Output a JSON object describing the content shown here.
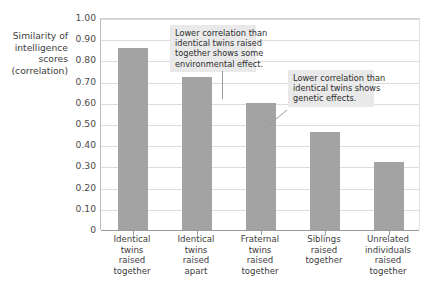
{
  "chart_data": {
    "type": "bar",
    "title": "",
    "xlabel": "",
    "ylabel": "Similarity of intelligence scores (correlation)",
    "ylim": [
      0,
      1.0
    ],
    "grid": true,
    "legend": "none",
    "categories": [
      "Identical twins raised together",
      "Identical twins raised apart",
      "Fraternal twins raised together",
      "Siblings raised together",
      "Unrelated individuals raised together"
    ],
    "values": [
      0.86,
      0.72,
      0.6,
      0.46,
      0.32
    ],
    "ytick_labels": [
      "1.00",
      "0.90",
      "0.80",
      "0.70",
      "0.60",
      "0.50",
      "0.40",
      "0.30",
      "0.20",
      "0.10",
      "0"
    ],
    "ytick_values": [
      1.0,
      0.9,
      0.8,
      0.7,
      0.6,
      0.5,
      0.4,
      0.3,
      0.2,
      0.1,
      0
    ],
    "annotations": [
      {
        "text": "Lower correlation than identical twins raised together shows some environmental effect.",
        "points_to": "Identical twins raised apart"
      },
      {
        "text": "Lower correlation than identical twins shows genetic effects.",
        "points_to": "Fraternal twins raised together"
      }
    ],
    "bar_color": "#a3a3a3"
  },
  "axis_title": {
    "line1": "Similarity of",
    "line2": "intelligence",
    "line3": "scores",
    "line4": "(correlation)"
  },
  "xlabels": [
    {
      "l1": "Identical",
      "l2": "twins",
      "l3": "raised",
      "l4": "together"
    },
    {
      "l1": "Identical",
      "l2": "twins",
      "l3": "raised",
      "l4": "apart"
    },
    {
      "l1": "Fraternal",
      "l2": "twins",
      "l3": "raised",
      "l4": "together"
    },
    {
      "l1": "Siblings",
      "l2": "raised",
      "l3": "together",
      "l4": ""
    },
    {
      "l1": "Unrelated",
      "l2": "individuals",
      "l3": "raised",
      "l4": "together"
    }
  ],
  "callouts": {
    "first": {
      "l1": "Lower correlation than",
      "l2": "identical twins raised",
      "l3": "together shows some",
      "l4": "environmental effect."
    },
    "second": {
      "l1": "Lower correlation than",
      "l2": "identical twins shows",
      "l3": "genetic effects.",
      "l4": ""
    }
  }
}
